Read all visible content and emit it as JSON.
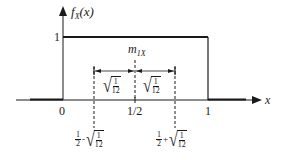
{
  "diagram": {
    "y_axis_label": {
      "func": "f",
      "sub": "X",
      "arg": "(x)"
    },
    "x_axis_label": "x",
    "y_tick_one": "1",
    "x_ticks": {
      "zero": "0",
      "half": "1/2",
      "one": "1"
    },
    "mean_label": {
      "base": "m",
      "sub": "1X"
    },
    "std_label": {
      "num": "1",
      "den": "12"
    },
    "lower_bound": {
      "left_num": "1",
      "left_den": "2",
      "op": "-",
      "sqrt_num": "1",
      "sqrt_den": "12"
    },
    "upper_bound": {
      "left_num": "1",
      "left_den": "2",
      "op": "+",
      "sqrt_num": "1",
      "sqrt_den": "12"
    },
    "colors": {
      "line": "#1a1a1a",
      "background": "#ffffff"
    }
  }
}
